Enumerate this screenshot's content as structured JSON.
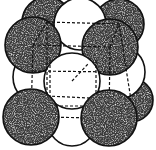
{
  "diagram": {
    "colors": {
      "background": "#ffffff",
      "outline": "#111111",
      "dark_atom_fill": "#3a3a3a",
      "dark_atom_speckle": "#d8d8d8",
      "light_atom_fill": "#ffffff",
      "edge_dash": "#111111"
    },
    "atoms": [
      {
        "id": "back-top-left-corner",
        "kind": "dark",
        "cx": 47,
        "cy": 22,
        "r": 25
      },
      {
        "id": "back-top-right-corner",
        "kind": "dark",
        "cx": 119,
        "cy": 24,
        "r": 25
      },
      {
        "id": "back-bottom-right-corner",
        "kind": "dark",
        "cx": 131,
        "cy": 100,
        "r": 22
      },
      {
        "id": "top-face-center",
        "kind": "light",
        "cx": 80,
        "cy": 24,
        "r": 26
      },
      {
        "id": "left-face-center",
        "kind": "light",
        "cx": 40,
        "cy": 77,
        "r": 27
      },
      {
        "id": "right-face-center",
        "kind": "light",
        "cx": 118,
        "cy": 72,
        "r": 27
      },
      {
        "id": "bottom-face-center",
        "kind": "light",
        "cx": 72,
        "cy": 122,
        "r": 24
      },
      {
        "id": "front-top-left-corner",
        "kind": "dark",
        "cx": 33,
        "cy": 45,
        "r": 28
      },
      {
        "id": "front-top-right-corner",
        "kind": "dark",
        "cx": 110,
        "cy": 47,
        "r": 28
      },
      {
        "id": "front-face-center",
        "kind": "light",
        "cx": 72,
        "cy": 81,
        "r": 28
      },
      {
        "id": "front-bottom-left-corner",
        "kind": "dark",
        "cx": 31,
        "cy": 117,
        "r": 28
      },
      {
        "id": "front-bottom-right-corner",
        "kind": "dark",
        "cx": 109,
        "cy": 118,
        "r": 28
      }
    ],
    "edges": [
      {
        "x1": 33,
        "y1": 45,
        "x2": 110,
        "y2": 47
      },
      {
        "x1": 31,
        "y1": 117,
        "x2": 109,
        "y2": 118
      },
      {
        "x1": 33,
        "y1": 45,
        "x2": 31,
        "y2": 117
      },
      {
        "x1": 110,
        "y1": 47,
        "x2": 109,
        "y2": 118
      },
      {
        "x1": 47,
        "y1": 22,
        "x2": 119,
        "y2": 24
      },
      {
        "x1": 47,
        "y1": 22,
        "x2": 47,
        "y2": 96
      },
      {
        "x1": 119,
        "y1": 24,
        "x2": 131,
        "y2": 100
      },
      {
        "x1": 47,
        "y1": 96,
        "x2": 131,
        "y2": 100
      },
      {
        "x1": 33,
        "y1": 45,
        "x2": 47,
        "y2": 22
      },
      {
        "x1": 110,
        "y1": 47,
        "x2": 119,
        "y2": 24
      },
      {
        "x1": 31,
        "y1": 117,
        "x2": 47,
        "y2": 96
      },
      {
        "x1": 109,
        "y1": 118,
        "x2": 131,
        "y2": 100
      },
      {
        "x1": 33,
        "y1": 71,
        "x2": 118,
        "y2": 72
      },
      {
        "x1": 50,
        "y1": 60,
        "x2": 50,
        "y2": 106
      },
      {
        "x1": 96,
        "y1": 60,
        "x2": 96,
        "y2": 106
      },
      {
        "x1": 50,
        "y1": 106,
        "x2": 96,
        "y2": 106
      },
      {
        "x1": 72,
        "y1": 81,
        "x2": 88,
        "y2": 64
      }
    ]
  }
}
